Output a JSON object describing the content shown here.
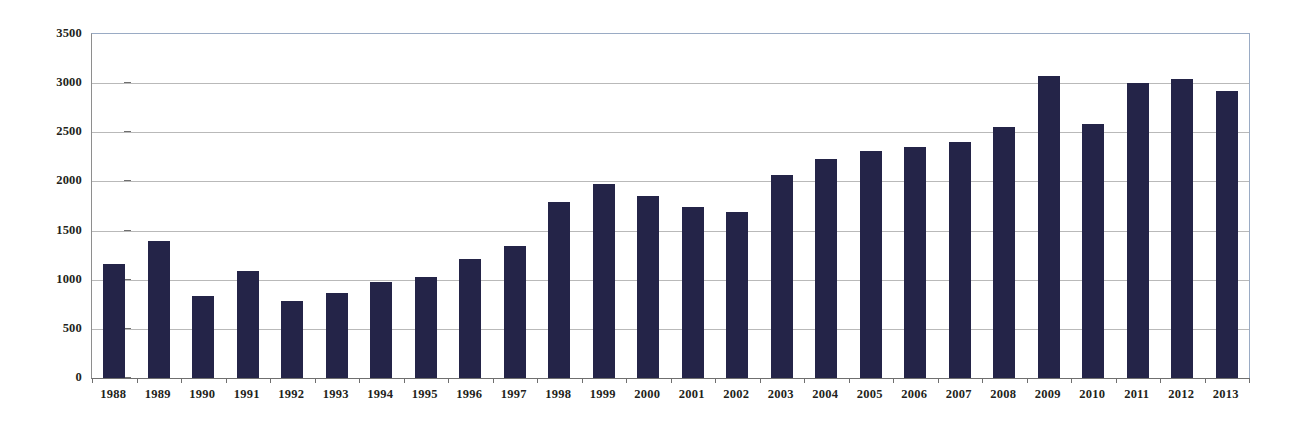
{
  "chart_data": {
    "type": "bar",
    "title": "",
    "xlabel": "",
    "ylabel": "",
    "ylim": [
      0,
      3500
    ],
    "ytick_step": 500,
    "yticks": [
      0,
      500,
      1000,
      1500,
      2000,
      2500,
      3000,
      3500
    ],
    "ytick_labels": [
      "0",
      "500",
      "1000",
      "1500",
      "2000",
      "2500",
      "3000",
      "3500"
    ],
    "grid": true,
    "legend": false,
    "legend_position": "none",
    "bar_color": "#242448",
    "gridline_color": "#b9b9b9",
    "axis_color": "#6f6f6f",
    "plot_border_color": "#9aabc4",
    "categories": [
      "1988",
      "1989",
      "1990",
      "1991",
      "1992",
      "1993",
      "1994",
      "1995",
      "1996",
      "1997",
      "1998",
      "1999",
      "2000",
      "2001",
      "2002",
      "2003",
      "2004",
      "2005",
      "2006",
      "2007",
      "2008",
      "2009",
      "2010",
      "2011",
      "2012",
      "2013"
    ],
    "values": [
      1155,
      1390,
      835,
      1085,
      780,
      860,
      980,
      1030,
      1215,
      1340,
      1790,
      1970,
      1850,
      1740,
      1690,
      2070,
      2230,
      2305,
      2355,
      2400,
      2555,
      3070,
      2585,
      3000,
      3040,
      2920
    ]
  }
}
